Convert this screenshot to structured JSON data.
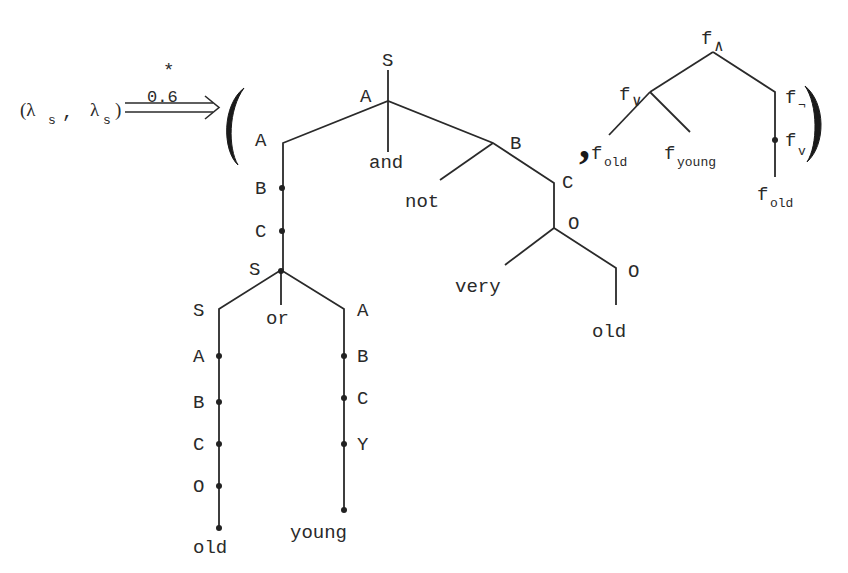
{
  "relation": {
    "left": "(λ",
    "left_sub": "s",
    "comma": ",",
    "right": "λ",
    "right_sub": "s",
    "close": ")",
    "arrow_superscript": "*",
    "arrow_weight": "0.6"
  },
  "tuple": {
    "open_paren": "(",
    "separator": ",",
    "close_paren": ")"
  },
  "syntax_tree": {
    "root": "S",
    "root_child_label": "A",
    "left_A": "A",
    "left_B": "B",
    "left_C": "C",
    "left_S": "S",
    "and_word": "and",
    "right_B": "B",
    "not_word": "not",
    "right_C": "C",
    "right_O1": "O",
    "very_word": "very",
    "right_O2": "O",
    "old_word_right": "old",
    "sub_S": "S",
    "sub_S_A": "A",
    "sub_S_B": "B",
    "sub_S_C": "C",
    "sub_S_O": "O",
    "old_word_left": "old",
    "or_word": "or",
    "sub_A": "A",
    "sub_A_B": "B",
    "sub_A_C": "C",
    "sub_A_Y": "Y",
    "young_word": "young"
  },
  "semantic_tree": {
    "root": "f",
    "root_sub": "∧",
    "or_node": "f",
    "or_sub": "∨",
    "not_node": "f",
    "not_sub": "¬",
    "very_node": "f",
    "very_sub": "v",
    "leaf_old_1": "f",
    "leaf_old_1_sub": "old",
    "leaf_young": "f",
    "leaf_young_sub": "young",
    "leaf_old_2": "f",
    "leaf_old_2_sub": "old"
  }
}
